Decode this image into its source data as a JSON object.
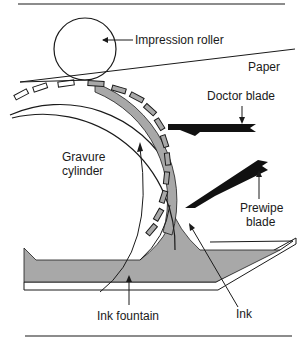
{
  "diagram": {
    "labels": {
      "impression_roller": "Impression roller",
      "paper": "Paper",
      "doctor_blade": "Doctor blade",
      "gravure_cylinder_line1": "Gravure",
      "gravure_cylinder_line2": "cylinder",
      "prewipe_blade_line1": "Prewipe",
      "prewipe_blade_line2": "blade",
      "ink_fountain": "Ink fountain",
      "ink": "Ink"
    },
    "colors": {
      "ink_fill": "#a8a8a8",
      "blade": "#111111",
      "line": "#1a1a1a",
      "background": "#ffffff"
    }
  }
}
